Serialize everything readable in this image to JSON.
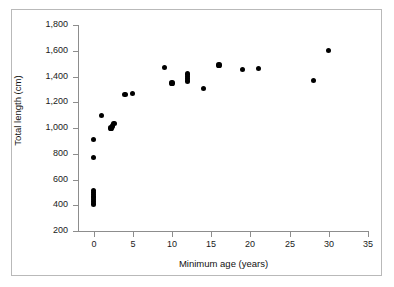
{
  "chart_data": {
    "type": "scatter",
    "title": "",
    "xlabel": "Minimum age (years)",
    "ylabel": "Total length (cm)",
    "xlim": [
      -2,
      35
    ],
    "ylim": [
      200,
      1800
    ],
    "xticks": [
      0,
      5,
      10,
      15,
      20,
      25,
      30,
      35
    ],
    "xtick_labels": [
      "0",
      "5",
      "10",
      "15",
      "20",
      "25",
      "30",
      "35"
    ],
    "yticks": [
      200,
      400,
      600,
      800,
      1000,
      1200,
      1400,
      1600,
      1800
    ],
    "ytick_labels": [
      "200",
      "400",
      "600",
      "800",
      "1,000",
      "1,200",
      "1,400",
      "1,600",
      "1,800"
    ],
    "grid": false,
    "legend": null,
    "marker": "filled-circle",
    "marker_color": "#000000",
    "series": [
      {
        "name": "specimens",
        "points": [
          {
            "x": 0.0,
            "y": 410
          },
          {
            "x": 0.0,
            "y": 430
          },
          {
            "x": 0.0,
            "y": 445
          },
          {
            "x": 0.0,
            "y": 460
          },
          {
            "x": 0.0,
            "y": 470
          },
          {
            "x": 0.0,
            "y": 485
          },
          {
            "x": 0.0,
            "y": 500
          },
          {
            "x": 0.0,
            "y": 515
          },
          {
            "x": 0.0,
            "y": 770
          },
          {
            "x": 0.0,
            "y": 910
          },
          {
            "x": 1.0,
            "y": 1100
          },
          {
            "x": 2.2,
            "y": 1000
          },
          {
            "x": 2.4,
            "y": 1015
          },
          {
            "x": 2.6,
            "y": 1035
          },
          {
            "x": 4.0,
            "y": 1260
          },
          {
            "x": 5.0,
            "y": 1270
          },
          {
            "x": 9.0,
            "y": 1470
          },
          {
            "x": 10.0,
            "y": 1350
          },
          {
            "x": 12.0,
            "y": 1365
          },
          {
            "x": 12.0,
            "y": 1385
          },
          {
            "x": 12.0,
            "y": 1400
          },
          {
            "x": 12.0,
            "y": 1420
          },
          {
            "x": 14.0,
            "y": 1305
          },
          {
            "x": 16.0,
            "y": 1490
          },
          {
            "x": 19.0,
            "y": 1455
          },
          {
            "x": 21.0,
            "y": 1460
          },
          {
            "x": 28.0,
            "y": 1370
          },
          {
            "x": 30.0,
            "y": 1600
          }
        ]
      }
    ]
  }
}
